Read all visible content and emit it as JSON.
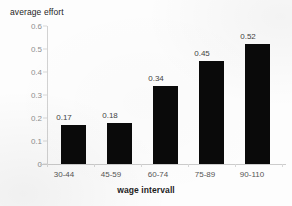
{
  "chart_data": {
    "type": "bar",
    "title": "",
    "xlabel": "wage intervall",
    "ylabel": "average effort",
    "categories": [
      "30-44",
      "45-59",
      "60-74",
      "75-89",
      "90-110"
    ],
    "values": [
      0.17,
      0.18,
      0.34,
      0.45,
      0.52
    ],
    "value_labels": [
      "0.17",
      "0.18",
      "0.34",
      "0.45",
      "0.52"
    ],
    "ylim": [
      0,
      0.6
    ],
    "ytick_labels": [
      "0.6",
      "0.5",
      "0.4",
      "0.3",
      "0.2",
      "0.1",
      "0"
    ],
    "ytick_values": [
      0.6,
      0.5,
      0.4,
      0.3,
      0.2,
      0.1,
      0
    ],
    "grid": false,
    "legend": false,
    "legend_position": "none",
    "bar_color": "#0a0a0a",
    "axis_color": "#d2d2d2",
    "tick_label_color": "#8e8e8e",
    "background_color": "#fdfdfd"
  }
}
